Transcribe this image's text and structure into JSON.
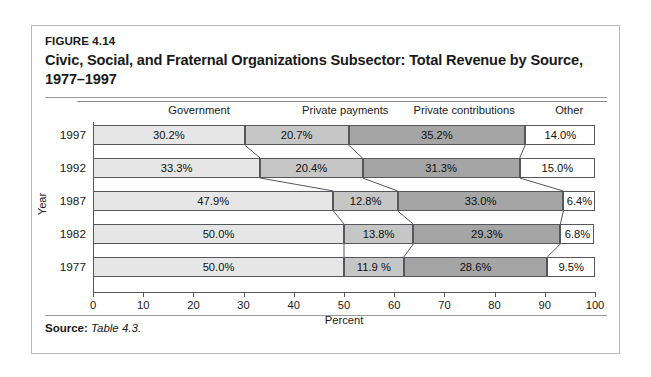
{
  "figure": {
    "label": "FIGURE 4.14",
    "title": "Civic, Social, and Fraternal Organizations Subsector: Total Revenue by Source, 1977–1997",
    "source_label": "Source:",
    "source_value": "Table 4.3."
  },
  "chart_data": {
    "type": "bar",
    "orientation": "horizontal",
    "stacked": true,
    "normalized_percent": true,
    "title": "Civic, Social, and Fraternal Organizations Subsector: Total Revenue by Source, 1977–1997",
    "xlabel": "Percent",
    "ylabel": "Year",
    "xlim": [
      0,
      100
    ],
    "xticks": [
      0,
      10,
      20,
      30,
      40,
      50,
      60,
      70,
      80,
      90,
      100
    ],
    "xtick_labels": [
      "0",
      "10",
      "20",
      "30",
      "40",
      "50",
      "60",
      "70",
      "80",
      "90",
      "100"
    ],
    "grid": false,
    "legend": "column-headers-above-plot",
    "categories": [
      "1997",
      "1992",
      "1987",
      "1982",
      "1977"
    ],
    "series": [
      {
        "name": "Government",
        "color": "#e6e6e6",
        "values": [
          30.2,
          33.3,
          47.9,
          50.0,
          50.0
        ],
        "labels": [
          "30.2%",
          "33.3%",
          "47.9%",
          "50.0%",
          "50.0%"
        ]
      },
      {
        "name": "Private payments",
        "color": "#c6c6c6",
        "values": [
          20.7,
          20.4,
          12.8,
          13.8,
          11.9
        ],
        "labels": [
          "20.7%",
          "20.4%",
          "12.8%",
          "13.8%",
          "11.9 %"
        ]
      },
      {
        "name": "Private contributions",
        "color": "#a5a5a5",
        "values": [
          35.2,
          31.3,
          33.0,
          29.3,
          28.6
        ],
        "labels": [
          "35.2%",
          "31.3%",
          "33.0%",
          "29.3%",
          "28.6%"
        ]
      },
      {
        "name": "Other",
        "color": "#ffffff",
        "values": [
          14.0,
          15.0,
          6.4,
          6.8,
          9.5
        ],
        "labels": [
          "14.0%",
          "15.0%",
          "6.4%",
          "6.8%",
          "9.5%"
        ]
      }
    ],
    "column_headers": [
      "Government",
      "Private payments",
      "Private contributions",
      "Other"
    ]
  }
}
